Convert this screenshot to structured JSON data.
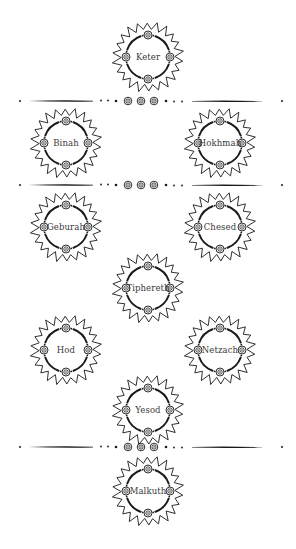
{
  "diagram": {
    "title": "",
    "ink_color": "#1a1a1a",
    "background": "#ffffff",
    "sephirot": [
      {
        "id": "keter",
        "label": "Keter",
        "cx": 148,
        "cy": 57
      },
      {
        "id": "binah",
        "label": "Binah",
        "cx": 66,
        "cy": 143
      },
      {
        "id": "hokhmah",
        "label": "Hokhmah",
        "cx": 220,
        "cy": 143
      },
      {
        "id": "geburah",
        "label": "Geburah",
        "cx": 66,
        "cy": 227
      },
      {
        "id": "chesed",
        "label": "Chesed",
        "cx": 220,
        "cy": 227
      },
      {
        "id": "tiphereth",
        "label": "Tiphereth",
        "cx": 148,
        "cy": 288
      },
      {
        "id": "hod",
        "label": "Hod",
        "cx": 66,
        "cy": 350
      },
      {
        "id": "netzach",
        "label": "Netzach",
        "cx": 220,
        "cy": 350
      },
      {
        "id": "yesod",
        "label": "Yesod",
        "cx": 148,
        "cy": 410
      },
      {
        "id": "malkuth",
        "label": "Malkuth",
        "cx": 148,
        "cy": 491
      }
    ],
    "dividers": [
      {
        "id": "divider-1",
        "y": 101
      },
      {
        "id": "divider-2",
        "y": 185
      },
      {
        "id": "divider-3",
        "y": 447
      }
    ]
  }
}
